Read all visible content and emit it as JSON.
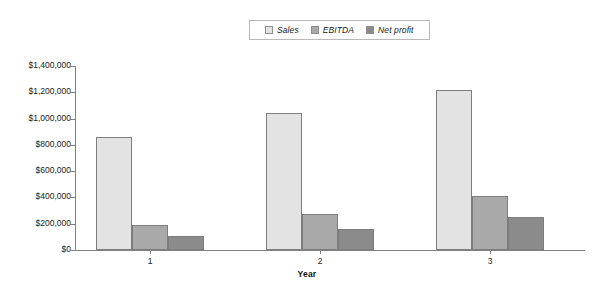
{
  "chart_data": {
    "type": "bar",
    "title": "",
    "xlabel": "Year",
    "ylabel": "",
    "categories": [
      "1",
      "2",
      "3"
    ],
    "series": [
      {
        "name": "Sales",
        "color": "#e3e3e3",
        "values": [
          860000,
          1040000,
          1220000
        ]
      },
      {
        "name": "EBITDA",
        "color": "#a9a9a9",
        "values": [
          190000,
          275000,
          410000
        ]
      },
      {
        "name": "Net profit",
        "color": "#8b8b8b",
        "values": [
          105000,
          160000,
          255000
        ]
      }
    ],
    "ylim": [
      0,
      1400000
    ],
    "ytick_values": [
      0,
      200000,
      400000,
      600000,
      800000,
      1000000,
      1200000,
      1400000
    ],
    "ytick_labels": [
      "$0",
      "$200,000",
      "$400,000",
      "$600,000",
      "$800,000",
      "$1,000,000",
      "$1,200,000",
      "$1,400,000"
    ],
    "grid": false,
    "legend_position": "top-center",
    "axis_color": "#808080",
    "bar_border_color": "#7d7d7d",
    "background": "#ffffff"
  }
}
